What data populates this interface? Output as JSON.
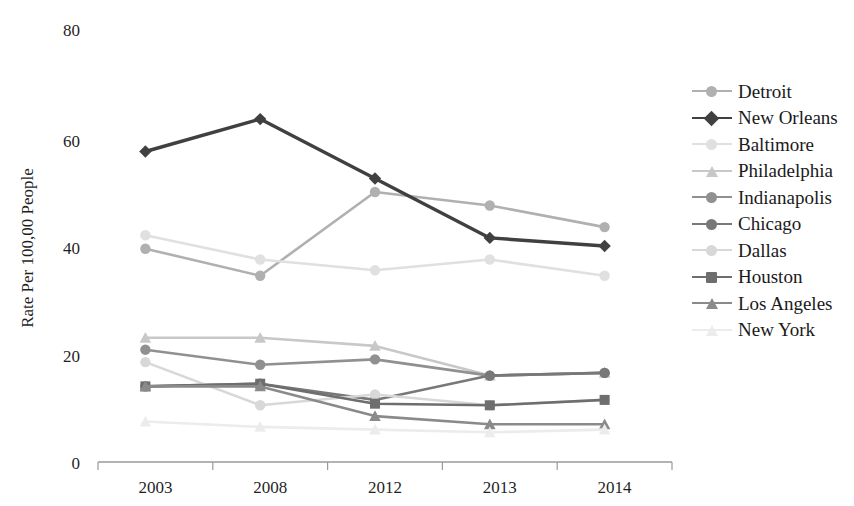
{
  "chart_data": {
    "type": "line",
    "title": "",
    "xlabel": "",
    "ylabel": "Rate Per 100,00 People",
    "categories": [
      "2003",
      "2008",
      "2012",
      "2013",
      "2014"
    ],
    "ylim": [
      0,
      80
    ],
    "yticks": [
      0,
      20,
      40,
      60,
      80
    ],
    "ytick_labels": [
      "0",
      "20",
      "40",
      "60",
      "80"
    ],
    "grid": false,
    "legend_position": "right",
    "series": [
      {
        "name": "Detroit",
        "values": [
          39.5,
          34.5,
          50.0,
          47.5,
          43.5
        ],
        "color": "#b0b0b0",
        "marker": "circle"
      },
      {
        "name": "New Orleans",
        "values": [
          57.5,
          63.5,
          52.5,
          41.5,
          40.0
        ],
        "color": "#404040",
        "marker": "diamond"
      },
      {
        "name": "Baltimore",
        "values": [
          42.0,
          37.5,
          35.5,
          37.5,
          34.5
        ],
        "color": "#e0e0e0",
        "marker": "circle"
      },
      {
        "name": "Philadelphia",
        "values": [
          23.0,
          23.0,
          21.5,
          16.0,
          16.5
        ],
        "color": "#c8c8c8",
        "marker": "triangle"
      },
      {
        "name": "Indianapolis",
        "values": [
          20.8,
          18.0,
          19.0,
          16.0,
          16.5
        ],
        "color": "#909090",
        "marker": "circle"
      },
      {
        "name": "Chicago",
        "values": [
          14.0,
          14.5,
          11.5,
          16.0,
          16.5
        ],
        "color": "#787878",
        "marker": "circle"
      },
      {
        "name": "Dallas",
        "values": [
          18.5,
          10.5,
          12.5,
          10.5,
          11.5
        ],
        "color": "#d8d8d8",
        "marker": "circle"
      },
      {
        "name": "Houston",
        "values": [
          14.0,
          14.5,
          10.8,
          10.5,
          11.5
        ],
        "color": "#6e6e6e",
        "marker": "square"
      },
      {
        "name": "Los Angeles",
        "values": [
          14.0,
          14.0,
          8.5,
          7.0,
          7.0
        ],
        "color": "#8a8a8a",
        "marker": "triangle"
      },
      {
        "name": "New York",
        "values": [
          7.5,
          6.5,
          6.0,
          5.5,
          6.0
        ],
        "color": "#ececec",
        "marker": "triangle"
      }
    ]
  },
  "axis": {
    "y_title": "Rate Per 100,00 People",
    "y_ticks": [
      "80",
      "60",
      "40",
      "20",
      "0"
    ],
    "x_ticks": [
      "2003",
      "2008",
      "2012",
      "2013",
      "2014"
    ]
  },
  "legend": {
    "items": [
      {
        "label": "Detroit"
      },
      {
        "label": "New Orleans"
      },
      {
        "label": "Baltimore"
      },
      {
        "label": "Philadelphia"
      },
      {
        "label": "Indianapolis"
      },
      {
        "label": "Chicago"
      },
      {
        "label": "Dallas"
      },
      {
        "label": "Houston"
      },
      {
        "label": "Los Angeles"
      },
      {
        "label": "New York"
      }
    ]
  }
}
